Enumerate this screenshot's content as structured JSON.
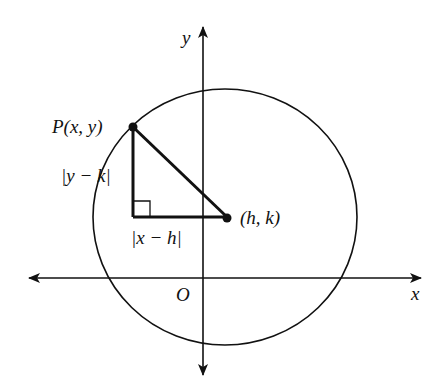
{
  "diagram": {
    "colors": {
      "stroke": "#111111",
      "background": "#ffffff"
    },
    "axes": {
      "x_label": "x",
      "y_label": "y",
      "origin_label": "O"
    },
    "points": {
      "p_label": "P(x, y)",
      "center_label": "(h, k)"
    },
    "legs": {
      "vertical_label": "|y − k|",
      "horizontal_label": "|x − h|"
    }
  }
}
